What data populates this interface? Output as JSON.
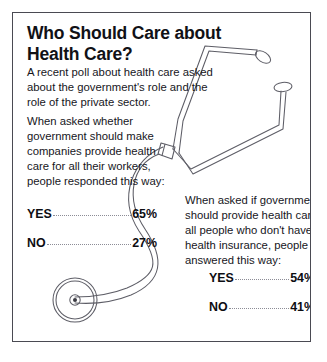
{
  "poster": {
    "title_line_1": "Who Should Care about",
    "title_line_2": "Health Care?",
    "intro": "A recent poll about health care asked about the government's role and the role of the private sector."
  },
  "poll_one": {
    "question": "When asked whether government should make companies provide health care for all their workers, people responded this way:",
    "results": [
      {
        "label": "YES",
        "value": "65%"
      },
      {
        "label": "NO",
        "value": "27%"
      }
    ]
  },
  "poll_two": {
    "question": "When asked if government should provide health care for all people who don't have health insurance, people answered this way:",
    "results": [
      {
        "label": "YES",
        "value": "54%"
      },
      {
        "label": "NO",
        "value": "41%"
      }
    ]
  },
  "illustration": {
    "name": "stethoscope-illustration",
    "line_color": "#5d5d66",
    "parts": [
      "ear-tip-left",
      "ear-tip-right",
      "binaural-tubes",
      "connector-collar",
      "flexible-tubing",
      "chest-piece"
    ]
  },
  "style": {
    "border_color": "#4a4a52",
    "background": "#ffffff",
    "text_color": "#16161c",
    "leader_color": "#8c8c96"
  }
}
